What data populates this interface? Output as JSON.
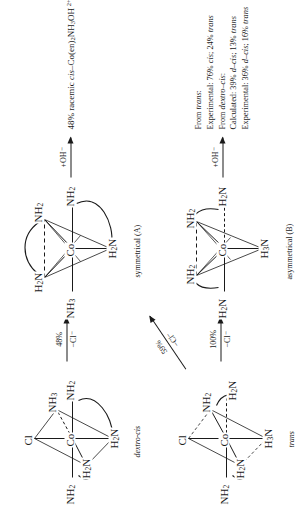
{
  "diagram": {
    "charge_superscript": "2+"
  },
  "molecules": [
    {
      "id": "symmetrical-a",
      "label": "symmetrical (A)",
      "charge": "2+",
      "center": "Co",
      "ligands": {
        "top_left": "H2N",
        "top_right": "NH2",
        "left": "NH3",
        "right": "NH2",
        "bottom": "H2N"
      }
    },
    {
      "id": "asymmetrical-b",
      "label": "asymmetrical (B)",
      "charge": "2+",
      "center": "Co",
      "ligands": {
        "top_left": "NH2",
        "top_right": "NH2",
        "left": "H2N",
        "right": "H2N",
        "bottom": "H3N"
      }
    },
    {
      "id": "dextro-cis",
      "label": "dextro-cis",
      "center": "Co",
      "ligands": {
        "top": "Cl",
        "top_right": "NH3",
        "left": "NH2",
        "right": "NH2",
        "inner_left": "H2N",
        "bottom": "H2N"
      }
    },
    {
      "id": "trans",
      "label": "trans",
      "center": "Co",
      "ligands": {
        "top": "Cl",
        "top_right": "NH2",
        "left": "NH2",
        "right": "H2N",
        "inner_left": "H2N",
        "bottom": "H3N"
      }
    }
  ],
  "arrows": [
    {
      "id": "dextro-to-sym",
      "above": "48%",
      "below": "−Cl⁻"
    },
    {
      "id": "dextro-to-asym",
      "above": "59%",
      "below": "−Cl⁻"
    },
    {
      "id": "trans-to-asym",
      "above": "100%",
      "below": "−Cl⁻"
    },
    {
      "id": "sym-to-product",
      "above": "+OH⁻",
      "below": ""
    },
    {
      "id": "asym-to-product",
      "above": "+OH⁻",
      "below": ""
    }
  ],
  "products": {
    "symmetrical_product": {
      "percent": "48%",
      "text": "48% racemic cis-Co(en)2NH3OH 2+"
    },
    "asymmetrical_results": [
      "From trans:",
      "Experimental: 76% cis; 24% trans",
      "From dextro-cis:",
      "Calculated: 39% d-cis; 13% trans",
      "Experimental: 36% d-cis; 16% trans"
    ]
  }
}
